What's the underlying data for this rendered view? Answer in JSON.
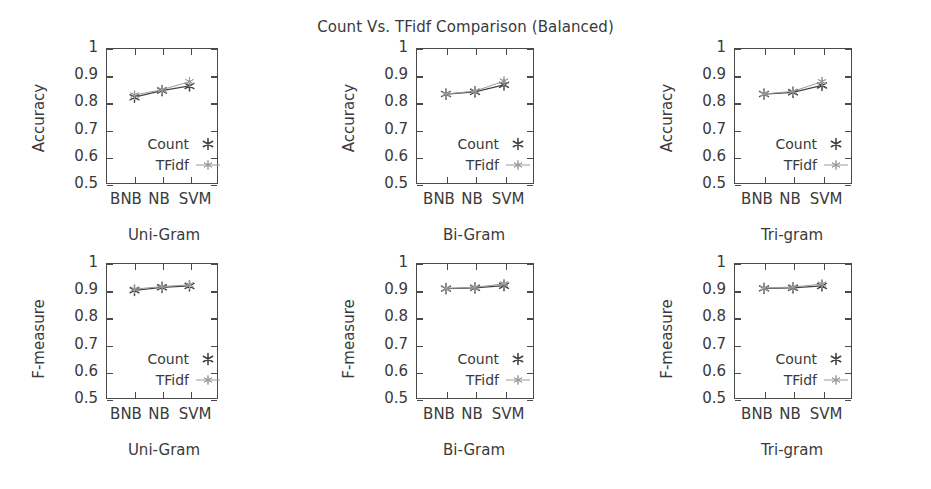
{
  "figure": {
    "title": "Count Vs. TFidf Comparison (Balanced)",
    "background": "#ffffff",
    "ink": "#3a3a3a"
  },
  "legend": {
    "count_label": "Count",
    "tfidf_label": "TFidf",
    "count_color": "#444444",
    "tfidf_color": "#9a9a9a",
    "position": "lower-left-inside"
  },
  "axis": {
    "yticks": [
      "1",
      "0.9",
      "0.8",
      "0.7",
      "0.6",
      "0.5"
    ],
    "ymin": 0.5,
    "ymax": 1.0,
    "xticks": [
      "BNB",
      "NB",
      "SVM"
    ],
    "ylabel_accuracy": "Accuracy",
    "ylabel_fmeasure": "F-measure"
  },
  "chart_data": [
    {
      "type": "line",
      "title": "Count Vs. TFidf Comparison (Balanced)",
      "panel": "accuracy-uni-gram",
      "xlabel": "Uni-Gram",
      "ylabel": "Accuracy",
      "categories": [
        "BNB",
        "NB",
        "SVM"
      ],
      "ylim": [
        0.5,
        1.0
      ],
      "grid": false,
      "legend": "inside-lower-left",
      "series": [
        {
          "name": "Count",
          "values": [
            0.82,
            0.845,
            0.862
          ]
        },
        {
          "name": "TFidf",
          "values": [
            0.828,
            0.848,
            0.878
          ]
        }
      ]
    },
    {
      "type": "line",
      "panel": "accuracy-bi-gram",
      "xlabel": "Bi-Gram",
      "ylabel": "Accuracy",
      "categories": [
        "BNB",
        "NB",
        "SVM"
      ],
      "ylim": [
        0.5,
        1.0
      ],
      "grid": false,
      "legend": "inside-lower-left",
      "series": [
        {
          "name": "Count",
          "values": [
            0.832,
            0.84,
            0.866
          ]
        },
        {
          "name": "TFidf",
          "values": [
            0.832,
            0.843,
            0.88
          ]
        }
      ]
    },
    {
      "type": "line",
      "panel": "accuracy-tri-gram",
      "xlabel": "Tri-gram",
      "ylabel": "Accuracy",
      "categories": [
        "BNB",
        "NB",
        "SVM"
      ],
      "ylim": [
        0.5,
        1.0
      ],
      "grid": false,
      "legend": "inside-lower-left",
      "series": [
        {
          "name": "Count",
          "values": [
            0.832,
            0.838,
            0.864
          ]
        },
        {
          "name": "TFidf",
          "values": [
            0.832,
            0.842,
            0.878
          ]
        }
      ]
    },
    {
      "type": "line",
      "panel": "fmeasure-uni-gram",
      "xlabel": "Uni-Gram",
      "ylabel": "F-measure",
      "categories": [
        "BNB",
        "NB",
        "SVM"
      ],
      "ylim": [
        0.5,
        1.0
      ],
      "grid": false,
      "legend": "inside-lower-left",
      "series": [
        {
          "name": "Count",
          "values": [
            0.902,
            0.913,
            0.918
          ]
        },
        {
          "name": "TFidf",
          "values": [
            0.906,
            0.916,
            0.922
          ]
        }
      ]
    },
    {
      "type": "line",
      "panel": "fmeasure-bi-gram",
      "xlabel": "Bi-Gram",
      "ylabel": "F-measure",
      "categories": [
        "BNB",
        "NB",
        "SVM"
      ],
      "ylim": [
        0.5,
        1.0
      ],
      "grid": false,
      "legend": "inside-lower-left",
      "series": [
        {
          "name": "Count",
          "values": [
            0.908,
            0.911,
            0.919
          ]
        },
        {
          "name": "TFidf",
          "values": [
            0.909,
            0.913,
            0.926
          ]
        }
      ]
    },
    {
      "type": "line",
      "panel": "fmeasure-tri-gram",
      "xlabel": "Tri-gram",
      "ylabel": "F-measure",
      "categories": [
        "BNB",
        "NB",
        "SVM"
      ],
      "ylim": [
        0.5,
        1.0
      ],
      "grid": false,
      "legend": "inside-lower-left",
      "series": [
        {
          "name": "Count",
          "values": [
            0.909,
            0.911,
            0.918
          ]
        },
        {
          "name": "TFidf",
          "values": [
            0.91,
            0.914,
            0.925
          ]
        }
      ]
    }
  ]
}
